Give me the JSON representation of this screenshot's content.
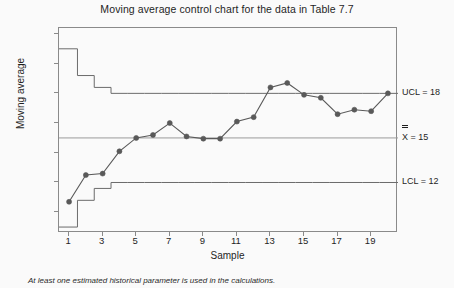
{
  "chart_data": {
    "type": "line",
    "title": "Moving average control chart for the data in Table 7.7",
    "xlabel": "Sample",
    "ylabel": "Moving average",
    "grid": false,
    "legend": "none",
    "xlim": [
      0.4,
      20.6
    ],
    "ylim": [
      8.6,
      22.4
    ],
    "x": [
      1,
      2,
      3,
      4,
      5,
      6,
      7,
      8,
      9,
      10,
      11,
      12,
      13,
      14,
      15,
      16,
      17,
      18,
      19,
      20
    ],
    "series": [
      {
        "name": "Moving average",
        "values": [
          10.7,
          12.5,
          12.6,
          14.1,
          15.0,
          15.2,
          16.0,
          15.1,
          14.95,
          14.95,
          16.1,
          16.4,
          18.4,
          18.7,
          17.9,
          17.7,
          16.6,
          16.9,
          16.8,
          18.0
        ],
        "marker": "filled-circle",
        "color": "#595959"
      },
      {
        "name": "UCL",
        "values": [
          21.0,
          19.2,
          18.4,
          18.0,
          18.0,
          18.0,
          18.0,
          18.0,
          18.0,
          18.0,
          18.0,
          18.0,
          18.0,
          18.0,
          18.0,
          18.0,
          18.0,
          18.0,
          18.0,
          18.0
        ],
        "style": "step",
        "color": "#6b6b6b"
      },
      {
        "name": "LCL",
        "values": [
          9.0,
          10.8,
          11.6,
          12.0,
          12.0,
          12.0,
          12.0,
          12.0,
          12.0,
          12.0,
          12.0,
          12.0,
          12.0,
          12.0,
          12.0,
          12.0,
          12.0,
          12.0,
          12.0,
          12.0
        ],
        "style": "step",
        "color": "#6b6b6b"
      },
      {
        "name": "Center line",
        "values": [
          15,
          15,
          15,
          15,
          15,
          15,
          15,
          15,
          15,
          15,
          15,
          15,
          15,
          15,
          15,
          15,
          15,
          15,
          15,
          15
        ],
        "style": "flat",
        "color": "#9a9a9a"
      }
    ],
    "yticks": [
      10,
      12,
      14,
      16,
      18,
      20,
      22
    ],
    "xticks": [
      1,
      3,
      5,
      7,
      9,
      11,
      13,
      15,
      17,
      19
    ],
    "annotations": {
      "ucl": {
        "text": "UCL = 18",
        "value": 18
      },
      "center": {
        "symbol": "X",
        "text": " = 15",
        "value": 15
      },
      "lcl": {
        "text": "LCL = 12",
        "value": 12
      }
    }
  },
  "footnote": "At least one estimated historical parameter is used in the calculations.",
  "colors": {
    "background": "#fafafa",
    "frame": "#8a8a8a",
    "data_line": "#595959",
    "limit_line": "#6b6b6b",
    "center_line": "#9a9a9a",
    "text": "#1f1f1f"
  }
}
